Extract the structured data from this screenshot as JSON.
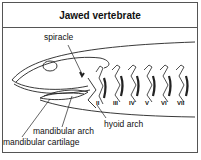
{
  "title": "Jawed vertebrate",
  "labels": {
    "spiracle": "spiracle",
    "hyoid_arch": "hyoid arch",
    "mandibular_arch": "mandibular arch",
    "mandibular_cartilage": "mandibular cartilage"
  },
  "arch_numerals": [
    "II",
    "III",
    "IV",
    "V",
    "VI",
    "VII"
  ]
}
